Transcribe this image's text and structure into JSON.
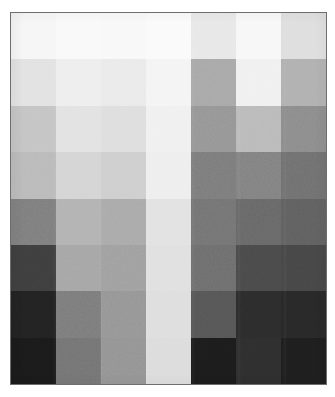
{
  "figure": {
    "background_color": "#ffffff",
    "frame_color": "#6e6e6e",
    "frame_style": "thin solid rectangle"
  },
  "chart_data": {
    "type": "heatmap",
    "title": "",
    "subtitle": "",
    "xlabel": "",
    "ylabel": "",
    "colormap": "grayscale",
    "grid": false,
    "legend": false,
    "legend_position": "none",
    "axis_ticks_visible": false,
    "tick_labels_visible": false,
    "n_rows": 8,
    "n_cols": 7,
    "row_labels": [
      "1",
      "2",
      "3",
      "4",
      "5",
      "6",
      "7",
      "8"
    ],
    "col_labels": [
      "1",
      "2",
      "3",
      "4",
      "5",
      "6",
      "7"
    ],
    "value_range": [
      0,
      255
    ],
    "value_unit": "gray level (0 = black, 255 = white)",
    "values": [
      [
        246,
        249,
        248,
        250,
        232,
        247,
        222
      ],
      [
        226,
        238,
        234,
        244,
        168,
        240,
        176
      ],
      [
        196,
        226,
        222,
        240,
        150,
        186,
        140
      ],
      [
        186,
        212,
        206,
        238,
        124,
        130,
        112
      ],
      [
        126,
        178,
        170,
        226,
        116,
        104,
        96
      ],
      [
        62,
        166,
        160,
        224,
        110,
        74,
        70
      ],
      [
        34,
        124,
        150,
        222,
        86,
        44,
        40
      ],
      [
        26,
        116,
        148,
        220,
        28,
        46,
        30
      ]
    ],
    "colors": [
      [
        "#f6f6f6",
        "#f9f9f9",
        "#f8f8f8",
        "#fafafa",
        "#e8e8e8",
        "#f7f7f7",
        "#dedede"
      ],
      [
        "#e2e2e2",
        "#eeeeee",
        "#eaeaea",
        "#f4f4f4",
        "#a8a8a8",
        "#f0f0f0",
        "#b0b0b0"
      ],
      [
        "#c4c4c4",
        "#e2e2e2",
        "#dedede",
        "#f0f0f0",
        "#969696",
        "#bababa",
        "#8c8c8c"
      ],
      [
        "#bababa",
        "#d4d4d4",
        "#cecece",
        "#eeeeee",
        "#7c7c7c",
        "#828282",
        "#707070"
      ],
      [
        "#7e7e7e",
        "#b2b2b2",
        "#aaaaaa",
        "#e2e2e2",
        "#747474",
        "#686868",
        "#606060"
      ],
      [
        "#3e3e3e",
        "#a6a6a6",
        "#a0a0a0",
        "#e0e0e0",
        "#6e6e6e",
        "#4a4a4a",
        "#464646"
      ],
      [
        "#222222",
        "#7c7c7c",
        "#969696",
        "#dedede",
        "#565656",
        "#2c2c2c",
        "#282828"
      ],
      [
        "#1a1a1a",
        "#747474",
        "#949494",
        "#dcdcdc",
        "#1c1c1c",
        "#2e2e2e",
        "#1e1e1e"
      ]
    ]
  }
}
